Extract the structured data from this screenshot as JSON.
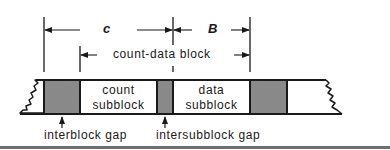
{
  "diagram": {
    "dimension_labels": {
      "c": "c",
      "B": "B",
      "count_data_block": "count-data block"
    },
    "blocks": {
      "count_subblock": "count\nsubblock",
      "count_subblock_line1": "count",
      "count_subblock_line2": "subblock",
      "data_subblock_line1": "data",
      "data_subblock_line2": "subblock"
    },
    "callouts": {
      "interblock_gap": "interblock gap",
      "intersubblock_gap": "intersubblock gap"
    },
    "colors": {
      "line": "#1a1a1a",
      "gap_fill": "#8c8c8c",
      "background": "#ffffff",
      "rule": "#6e6e6e"
    }
  }
}
